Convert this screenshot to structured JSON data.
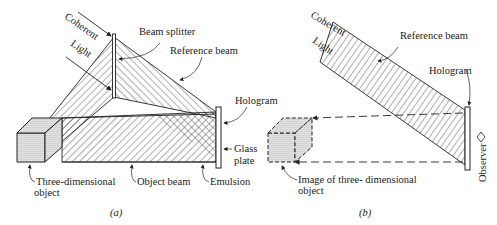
{
  "figure": {
    "panel_a": {
      "caption": "(a)",
      "labels": {
        "coherent": "Coherent",
        "light": "Light",
        "beam_splitter": "Beam splitter",
        "reference_beam": "Reference beam",
        "hologram": "Hologram",
        "glass": "Glass",
        "plate": "plate",
        "emulsion": "Emulsion",
        "object_line1": "Three-dimensional",
        "object_line2": "object",
        "object_beam": "Object beam"
      }
    },
    "panel_b": {
      "caption": "(b)",
      "labels": {
        "coherent": "Coherent",
        "light": "Light",
        "reference_beam": "Reference beam",
        "hologram": "Hologram",
        "observer": "Observer",
        "image_line1": "Image of three- dimensional",
        "image_line2": "object"
      }
    },
    "colors": {
      "ink": "#222222",
      "background": "#ffffff"
    }
  }
}
